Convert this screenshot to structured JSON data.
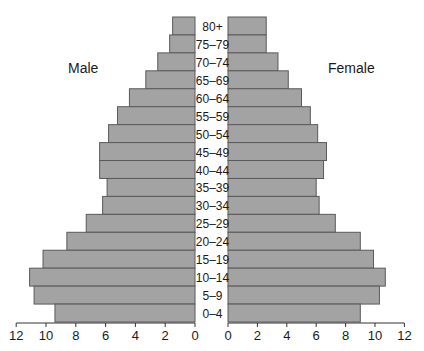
{
  "chart_data": {
    "type": "bar",
    "subtype": "population-pyramid",
    "title": "",
    "xlabel": "",
    "ylabel": "",
    "categories": [
      "80+",
      "75–79",
      "70–74",
      "65–69",
      "60–64",
      "55–59",
      "50–54",
      "45–49",
      "40–44",
      "35–39",
      "30–34",
      "25–29",
      "20–24",
      "15–19",
      "10–14",
      "5–9",
      "0–4"
    ],
    "series": [
      {
        "name": "Male",
        "side": "left",
        "values": [
          1.5,
          1.7,
          2.5,
          3.3,
          4.4,
          5.2,
          5.8,
          6.4,
          6.4,
          5.9,
          6.2,
          7.3,
          8.6,
          10.2,
          11.1,
          10.8,
          9.4
        ]
      },
      {
        "name": "Female",
        "side": "right",
        "values": [
          2.6,
          2.6,
          3.4,
          4.1,
          5.0,
          5.6,
          6.1,
          6.7,
          6.5,
          6.0,
          6.2,
          7.3,
          9.0,
          9.9,
          10.7,
          10.3,
          9.0
        ]
      }
    ],
    "xlim": [
      0,
      12
    ],
    "x_ticks_left": [
      "12",
      "10",
      "8",
      "6",
      "4",
      "2",
      "0"
    ],
    "x_ticks_right": [
      "0",
      "2",
      "4",
      "6",
      "8",
      "10",
      "12"
    ],
    "legend": [
      "Male",
      "Female"
    ],
    "grid": false,
    "bar_color": "#a3a3a3",
    "bar_edge_color": "#5a5a5a"
  },
  "labels": {
    "male": "Male",
    "female": "Female"
  }
}
